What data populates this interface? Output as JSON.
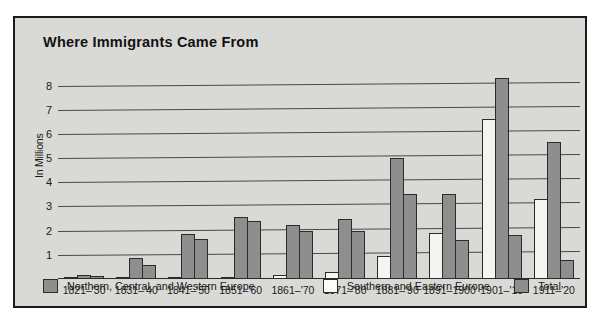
{
  "chart_data": {
    "type": "bar",
    "title": "Where Immigrants Came From",
    "xlabel": "",
    "ylabel": "In Millions",
    "ylim": [
      0,
      8.6
    ],
    "grid": true,
    "legend_position": "bottom",
    "yticks": [
      1,
      2,
      3,
      4,
      5,
      6,
      7,
      8
    ],
    "ytick_labels": [
      "1",
      "2",
      "3",
      "4",
      "5",
      "6",
      "7",
      "8"
    ],
    "categories": [
      "1821–'30",
      "1831–'40",
      "1841–'50",
      "1851–'60",
      "1861–'70",
      "1871–'80",
      "1881–'90",
      "1891–1900",
      "1901–'10",
      "1911–'20"
    ],
    "series": [
      {
        "name": "Southern and Eastern Europe",
        "color": "#f4f4f1",
        "values": [
          0.03,
          0.08,
          0.05,
          0.07,
          0.15,
          0.3,
          0.95,
          1.9,
          6.6,
          3.3
        ]
      },
      {
        "name": "Northern, Central, and Western Europe",
        "color": "#8e8e8e",
        "values": [
          0.15,
          0.85,
          1.85,
          2.55,
          2.25,
          2.5,
          5.0,
          3.5,
          8.3,
          5.65
        ]
      },
      {
        "name": "Total",
        "color": "#8e8e8e",
        "values": [
          0.14,
          0.6,
          1.65,
          2.4,
          2.0,
          2.0,
          3.5,
          1.6,
          1.8,
          0.8
        ]
      }
    ]
  },
  "legend": [
    {
      "label": "Northern, Central, and Western Europe",
      "swatch": "dark"
    },
    {
      "label": "Southern and Eastern Europe",
      "swatch": "light"
    },
    {
      "label": "Total",
      "swatch": "dark"
    }
  ],
  "colors": {
    "panel_background": "#d9d9d6",
    "border": "#1a1a1a",
    "bar_dark": "#8e8e8e",
    "bar_light": "#f4f4f1",
    "gridline": "#4a4a4a",
    "text": "#1a1a1a"
  }
}
